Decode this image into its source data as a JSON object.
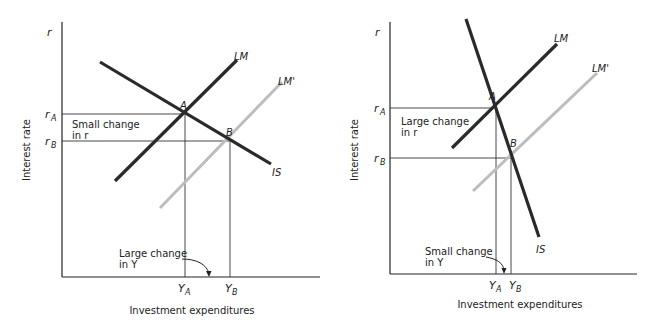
{
  "colors": {
    "curve": "#2a2a2a",
    "shifted_curve": "#bdbdbd",
    "axis": "#222222",
    "guide": "#333333",
    "text": "#222222"
  },
  "panels": [
    {
      "id": "left",
      "y_axis_symbol": "r",
      "y_label": "Interest rate",
      "x_label": "Investment expenditures",
      "r_a": "r",
      "r_a_sub": "A",
      "r_b": "r",
      "r_b_sub": "B",
      "y_a": "Y",
      "y_a_sub": "A",
      "y_b": "Y",
      "y_b_sub": "B",
      "curve_lm": "LM",
      "curve_lm_prime": "LM'",
      "curve_is": "IS",
      "point_a": "A",
      "point_b": "B",
      "r_note_line1": "Small change",
      "r_note_line2": "in r",
      "y_note_line1": "Large change",
      "y_note_line2": "in Y"
    },
    {
      "id": "right",
      "y_axis_symbol": "r",
      "y_label": "Interest rate",
      "x_label": "Investment expenditures",
      "r_a": "r",
      "r_a_sub": "A",
      "r_b": "r",
      "r_b_sub": "B",
      "y_a": "Y",
      "y_a_sub": "A",
      "y_b": "Y",
      "y_b_sub": "B",
      "curve_lm": "LM",
      "curve_lm_prime": "LM'",
      "curve_is": "IS",
      "point_a": "A",
      "point_b": "B",
      "r_note_line1": "Large change",
      "r_note_line2": "in r",
      "y_note_line1": "Small change",
      "y_note_line2": "in Y"
    }
  ]
}
